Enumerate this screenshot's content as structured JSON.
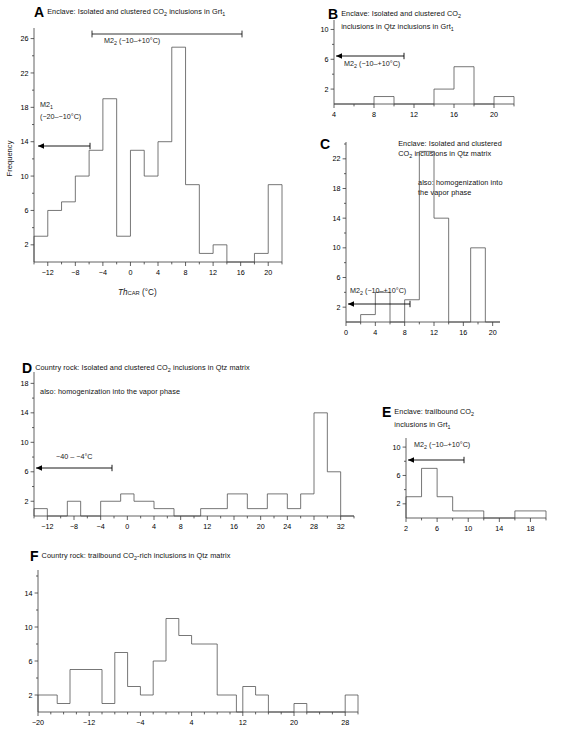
{
  "figure": {
    "panels": [
      {
        "letter": "A",
        "title_html": "Enclave: Isolated and clustered CO<sub>2</sub> inclusions in Grt<sub>1</sub>",
        "note_html": "",
        "ylabel": "Frequency",
        "xlabel_html": "<i>Th</i><span class=\"sub\">CAR</span> <span class=\"unit\">(°C)</span>",
        "annotations": [
          {
            "text_html": "M2<sub>2</sub> (−10–+10°C)",
            "kind": "range-bar"
          },
          {
            "text_html": "M2<sub>1</sub><br>(−20–−10°C)",
            "kind": "left-arrow"
          }
        ],
        "chart_data": {
          "type": "bar",
          "title": "Enclave: Isolated and clustered CO2 inclusions in Grt1",
          "xlabel": "Th_CAR (°C)",
          "ylabel": "Frequency",
          "xlim": [
            -14,
            22
          ],
          "ylim": [
            0,
            27
          ],
          "yticks": [
            2,
            6,
            10,
            14,
            18,
            22,
            26
          ],
          "xticks": [
            -12,
            -8,
            -4,
            0,
            4,
            8,
            12,
            16,
            20
          ],
          "bin_width": 2,
          "bins": [
            {
              "x0": -14,
              "x1": -12,
              "v": 3
            },
            {
              "x0": -12,
              "x1": -10,
              "v": 6
            },
            {
              "x0": -10,
              "x1": -8,
              "v": 7
            },
            {
              "x0": -8,
              "x1": -6,
              "v": 10
            },
            {
              "x0": -6,
              "x1": -4,
              "v": 13
            },
            {
              "x0": -4,
              "x1": -2,
              "v": 19
            },
            {
              "x0": -2,
              "x1": 0,
              "v": 3
            },
            {
              "x0": 0,
              "x1": 2,
              "v": 13
            },
            {
              "x0": 2,
              "x1": 4,
              "v": 10
            },
            {
              "x0": 4,
              "x1": 6,
              "v": 14
            },
            {
              "x0": 6,
              "x1": 8,
              "v": 25
            },
            {
              "x0": 8,
              "x1": 10,
              "v": 9
            },
            {
              "x0": 10,
              "x1": 12,
              "v": 1
            },
            {
              "x0": 12,
              "x1": 14,
              "v": 2
            },
            {
              "x0": 14,
              "x1": 18,
              "v": 0
            },
            {
              "x0": 18,
              "x1": 20,
              "v": 1
            },
            {
              "x0": 20,
              "x1": 22,
              "v": 9
            }
          ]
        }
      },
      {
        "letter": "B",
        "title_html": "Enclave: Isolated and clustered CO<sub>2</sub><br>inclusions in Qtz inclusions in Grt<sub>1</sub>",
        "note_html": "",
        "ylabel": "",
        "xlabel_html": "",
        "annotations": [
          {
            "text_html": "M2<sub>2</sub> (−10–+10°C)",
            "kind": "left-arrow"
          }
        ],
        "chart_data": {
          "type": "bar",
          "title": "Enclave: Isolated and clustered CO2 inclusions in Qtz inclusions in Grt1",
          "xlabel": "",
          "ylabel": "Frequency",
          "xlim": [
            4,
            22
          ],
          "ylim": [
            0,
            11
          ],
          "yticks": [
            2,
            6,
            10
          ],
          "xticks": [
            4,
            8,
            12,
            16,
            20
          ],
          "bin_width": 2,
          "bins": [
            {
              "x0": 4,
              "x1": 8,
              "v": 0
            },
            {
              "x0": 8,
              "x1": 10,
              "v": 1
            },
            {
              "x0": 10,
              "x1": 14,
              "v": 0
            },
            {
              "x0": 14,
              "x1": 16,
              "v": 2
            },
            {
              "x0": 16,
              "x1": 18,
              "v": 5
            },
            {
              "x0": 18,
              "x1": 20,
              "v": 0
            },
            {
              "x0": 20,
              "x1": 22,
              "v": 1
            }
          ]
        }
      },
      {
        "letter": "C",
        "title_html": "Enclave: Isolated and clustered<br>CO<sub>2</sub> inclusions in Qtz matrix",
        "note_html": "also: homogenization into<br>the vapor phase",
        "ylabel": "",
        "xlabel_html": "",
        "annotations": [
          {
            "text_html": "M2<sub>2</sub> (−10–+10°C)",
            "kind": "left-arrow"
          }
        ],
        "chart_data": {
          "type": "bar",
          "title": "Enclave: Isolated and clustered CO2 inclusions in Qtz matrix",
          "xlabel": "",
          "ylabel": "Frequency",
          "xlim": [
            0,
            21
          ],
          "ylim": [
            0,
            24
          ],
          "yticks": [
            2,
            6,
            10,
            14,
            18,
            22
          ],
          "xticks": [
            0,
            4,
            8,
            12,
            16,
            20
          ],
          "bin_width": 2,
          "bins": [
            {
              "x0": 0,
              "x1": 2,
              "v": 0
            },
            {
              "x0": 2,
              "x1": 4,
              "v": 1
            },
            {
              "x0": 4,
              "x1": 6,
              "v": 4
            },
            {
              "x0": 6,
              "x1": 8,
              "v": 0
            },
            {
              "x0": 8,
              "x1": 10,
              "v": 3
            },
            {
              "x0": 10,
              "x1": 12,
              "v": 23
            },
            {
              "x0": 12,
              "x1": 14,
              "v": 14
            },
            {
              "x0": 14,
              "x1": 17,
              "v": 0
            },
            {
              "x0": 17,
              "x1": 19,
              "v": 10
            },
            {
              "x0": 19,
              "x1": 21,
              "v": 0
            }
          ]
        }
      },
      {
        "letter": "D",
        "title_html": "Country rock: Isolated and clustered CO<sub>2</sub> inclusions in Qtz matrix",
        "note_html": "also: homogenization into the vapor phase",
        "ylabel": "",
        "xlabel_html": "",
        "annotations": [
          {
            "text_html": "−40 – −4°C",
            "kind": "left-arrow"
          }
        ],
        "chart_data": {
          "type": "bar",
          "title": "Country rock: Isolated and clustered CO2 inclusions in Qtz matrix",
          "xlabel": "",
          "ylabel": "Frequency",
          "xlim": [
            -14,
            34
          ],
          "ylim": [
            0,
            19
          ],
          "yticks": [
            2,
            6,
            10,
            14,
            18
          ],
          "xticks": [
            -12,
            -8,
            -4,
            0,
            4,
            8,
            12,
            16,
            20,
            24,
            28,
            32
          ],
          "bin_width": 2,
          "bins": [
            {
              "x0": -14,
              "x1": -12,
              "v": 1
            },
            {
              "x0": -12,
              "x1": -9,
              "v": 0
            },
            {
              "x0": -9,
              "x1": -7,
              "v": 2
            },
            {
              "x0": -7,
              "x1": -4,
              "v": 0
            },
            {
              "x0": -4,
              "x1": -1,
              "v": 2
            },
            {
              "x0": -1,
              "x1": 1,
              "v": 3
            },
            {
              "x0": 1,
              "x1": 4,
              "v": 2
            },
            {
              "x0": 4,
              "x1": 7,
              "v": 1
            },
            {
              "x0": 7,
              "x1": 11,
              "v": 0
            },
            {
              "x0": 11,
              "x1": 15,
              "v": 1
            },
            {
              "x0": 15,
              "x1": 18,
              "v": 3
            },
            {
              "x0": 18,
              "x1": 21,
              "v": 1
            },
            {
              "x0": 21,
              "x1": 24,
              "v": 3
            },
            {
              "x0": 24,
              "x1": 26,
              "v": 1
            },
            {
              "x0": 26,
              "x1": 28,
              "v": 3
            },
            {
              "x0": 28,
              "x1": 30,
              "v": 14
            },
            {
              "x0": 30,
              "x1": 32,
              "v": 6
            },
            {
              "x0": 32,
              "x1": 34,
              "v": 0
            }
          ]
        }
      },
      {
        "letter": "E",
        "title_html": "Enclave: trailbound CO<sub>2</sub><br>inclusions in Grt<sub>1</sub>",
        "note_html": "",
        "ylabel": "",
        "xlabel_html": "",
        "annotations": [
          {
            "text_html": "M2<sub>2</sub> (−10–+10°C)",
            "kind": "left-arrow"
          }
        ],
        "chart_data": {
          "type": "bar",
          "title": "Enclave: trailbound CO2 inclusions in Grt1",
          "xlabel": "",
          "ylabel": "Frequency",
          "xlim": [
            2,
            20
          ],
          "ylim": [
            0,
            11
          ],
          "yticks": [
            2,
            6,
            10
          ],
          "xticks": [
            2,
            6,
            10,
            14,
            18
          ],
          "bin_width": 2,
          "bins": [
            {
              "x0": 2,
              "x1": 4,
              "v": 3
            },
            {
              "x0": 4,
              "x1": 6,
              "v": 7
            },
            {
              "x0": 6,
              "x1": 8,
              "v": 3
            },
            {
              "x0": 8,
              "x1": 10,
              "v": 1
            },
            {
              "x0": 10,
              "x1": 12,
              "v": 1
            },
            {
              "x0": 12,
              "x1": 16,
              "v": 0
            },
            {
              "x0": 16,
              "x1": 20,
              "v": 1
            }
          ]
        }
      },
      {
        "letter": "F",
        "title_html": "Country rock: trailbound CO<sub>2</sub>-rich inclusions in Qtz matrix",
        "note_html": "",
        "ylabel": "",
        "xlabel_html": "",
        "annotations": [],
        "chart_data": {
          "type": "bar",
          "title": "Country rock: trailbound CO2-rich inclusions in Qtz matrix",
          "xlabel": "",
          "ylabel": "Frequency",
          "xlim": [
            -20,
            30
          ],
          "ylim": [
            0,
            16
          ],
          "yticks": [
            2,
            6,
            10,
            14
          ],
          "xticks": [
            -20,
            -12,
            -4,
            4,
            12,
            20,
            28
          ],
          "bin_width": 2,
          "bins": [
            {
              "x0": -20,
              "x1": -17,
              "v": 2
            },
            {
              "x0": -17,
              "x1": -15,
              "v": 1
            },
            {
              "x0": -15,
              "x1": -10,
              "v": 5
            },
            {
              "x0": -10,
              "x1": -8,
              "v": 1
            },
            {
              "x0": -8,
              "x1": -6,
              "v": 7
            },
            {
              "x0": -6,
              "x1": -4,
              "v": 3
            },
            {
              "x0": -4,
              "x1": -2,
              "v": 2
            },
            {
              "x0": -2,
              "x1": 0,
              "v": 6
            },
            {
              "x0": 0,
              "x1": 2,
              "v": 11
            },
            {
              "x0": 2,
              "x1": 4,
              "v": 9
            },
            {
              "x0": 4,
              "x1": 8,
              "v": 8
            },
            {
              "x0": 8,
              "x1": 11,
              "v": 2
            },
            {
              "x0": 11,
              "x1": 12,
              "v": 0
            },
            {
              "x0": 12,
              "x1": 14,
              "v": 3
            },
            {
              "x0": 14,
              "x1": 16,
              "v": 2
            },
            {
              "x0": 16,
              "x1": 20,
              "v": 0
            },
            {
              "x0": 20,
              "x1": 22,
              "v": 1
            },
            {
              "x0": 22,
              "x1": 28,
              "v": 0
            },
            {
              "x0": 28,
              "x1": 30,
              "v": 2
            }
          ]
        }
      }
    ]
  }
}
